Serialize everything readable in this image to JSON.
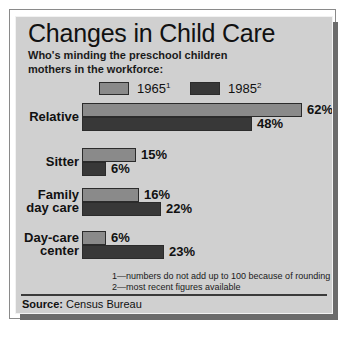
{
  "header": {
    "title": "Changes in Child Care",
    "subtitle": "Who's minding the preschool children\nmothers in the workforce:"
  },
  "legend": [
    {
      "label": "1965",
      "sup": "1",
      "color": "#8a8a8a"
    },
    {
      "label": "1985",
      "sup": "2",
      "color": "#383838"
    }
  ],
  "footnotes": "1—numbers do not add up to 100 because of rounding\n2—most recent figures available",
  "source": {
    "prefix": "Source:",
    "text": " Census Bureau"
  },
  "colors": {
    "panel_background": "#d0d0d0",
    "series_1965": "#8a8a8a",
    "series_1985": "#383838",
    "bar_outline": "#2b2b2b",
    "text": "#111111"
  },
  "chart_data": {
    "type": "bar",
    "orientation": "horizontal",
    "title": "Changes in Child Care",
    "subtitle": "Who's minding the preschool children mothers in the workforce:",
    "xlabel": "",
    "ylabel": "",
    "xlim": [
      0,
      62
    ],
    "grid": false,
    "legend_position": "top",
    "unit": "%",
    "categories": [
      "Relative",
      "Sitter",
      "Family day care",
      "Day-care center"
    ],
    "series": [
      {
        "name": "1965",
        "values": [
          62,
          15,
          16,
          6
        ],
        "labels": [
          "62%",
          "15%",
          "16%",
          "6%"
        ]
      },
      {
        "name": "1985",
        "values": [
          48,
          6,
          22,
          23
        ],
        "labels": [
          "48%",
          "6%",
          "22%",
          "23%"
        ]
      }
    ]
  },
  "groups": [
    {
      "label": "Relative",
      "rows": [
        {
          "series": "1965",
          "value_label": "62%",
          "width_px": 220,
          "color": "#8a8a8a"
        },
        {
          "series": "1985",
          "value_label": "48%",
          "width_px": 170,
          "color": "#383838"
        }
      ]
    },
    {
      "label": "Sitter",
      "rows": [
        {
          "series": "1965",
          "value_label": "15%",
          "width_px": 54,
          "color": "#8a8a8a"
        },
        {
          "series": "1985",
          "value_label": "6%",
          "width_px": 24,
          "color": "#383838"
        }
      ]
    },
    {
      "label": "Family\nday care",
      "rows": [
        {
          "series": "1965",
          "value_label": "16%",
          "width_px": 57,
          "color": "#8a8a8a"
        },
        {
          "series": "1985",
          "value_label": "22%",
          "width_px": 79,
          "color": "#383838"
        }
      ]
    },
    {
      "label": "Day-care\ncenter",
      "rows": [
        {
          "series": "1965",
          "value_label": "6%",
          "width_px": 24,
          "color": "#8a8a8a"
        },
        {
          "series": "1985",
          "value_label": "23%",
          "width_px": 82,
          "color": "#383838"
        }
      ]
    }
  ]
}
